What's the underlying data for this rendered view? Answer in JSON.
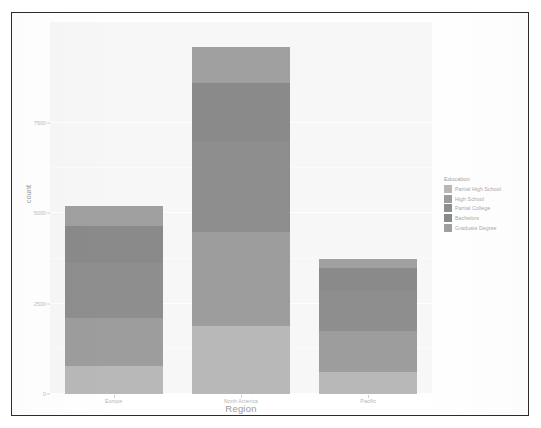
{
  "chart_data": {
    "type": "bar",
    "subtype": "stacked-bar",
    "title": "",
    "xlabel": "Region",
    "ylabel": "count",
    "categories": [
      "Europe",
      "North America",
      "Pacific"
    ],
    "legend_title": "Education",
    "legend_position": "right",
    "grid": true,
    "ylim": [
      0,
      10300
    ],
    "yticks": [
      0,
      2500,
      5000,
      7500
    ],
    "ytick_labels": [
      "0",
      "2500",
      "5000",
      "7500"
    ],
    "series": [
      {
        "name": "Partial High School",
        "color": "#b8b8b8",
        "values": [
          780,
          1880,
          600
        ]
      },
      {
        "name": "High School",
        "color": "#9d9d9d",
        "values": [
          1320,
          2610,
          1150
        ]
      },
      {
        "name": "Partial College",
        "color": "#8e8e8e",
        "values": [
          1520,
          2480,
          1090
        ]
      },
      {
        "name": "Bachelors",
        "color": "#8a8a8a",
        "values": [
          1020,
          1640,
          640
        ]
      },
      {
        "name": "Graduate Degree",
        "color": "#a0a0a0",
        "values": [
          560,
          990,
          270
        ]
      }
    ],
    "totals": [
      5200,
      9600,
      3750
    ]
  },
  "axes": {
    "y_title": "count",
    "x_title": "Region"
  },
  "legend": {
    "title": "Education",
    "items": [
      {
        "label": "Partial High School",
        "color": "#b8b8b8"
      },
      {
        "label": "High School",
        "color": "#9d9d9d"
      },
      {
        "label": "Partial College",
        "color": "#8e8e8e"
      },
      {
        "label": "Bachelors",
        "color": "#8a8a8a"
      },
      {
        "label": "Graduate Degree",
        "color": "#a0a0a0"
      }
    ]
  },
  "style": {
    "panel_background": "#f7f7f7",
    "figure_background": "#ffffff",
    "frame_color": "#2b2b2b",
    "gridline_color": "#ffffff",
    "tick_label_color": "#b9b9b9",
    "axis_title_color": "#9a9a9a"
  }
}
